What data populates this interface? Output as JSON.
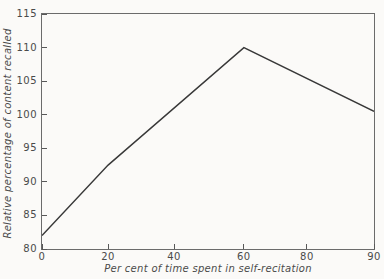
{
  "chart_data": {
    "type": "line",
    "title": "",
    "xlabel": "Per cent of time spent in self-recitation",
    "ylabel": "Relative percentage of content recalled",
    "xlim": [
      0,
      90
    ],
    "ylim": [
      80,
      115
    ],
    "x_ticks": [
      0,
      20,
      40,
      60,
      80,
      90
    ],
    "x_tick_fractions": [
      0,
      0.199,
      0.398,
      0.608,
      0.798,
      1.0
    ],
    "y_ticks": [
      80,
      85,
      90,
      95,
      100,
      105,
      110,
      115
    ],
    "grid": false,
    "legend": false,
    "series": [
      {
        "points": [
          {
            "x": 0,
            "y": 82
          },
          {
            "x": 20,
            "y": 92.5
          },
          {
            "x": 60,
            "y": 110
          },
          {
            "x": 90,
            "y": 100.5
          }
        ]
      }
    ],
    "line_color": "#383838",
    "axis_color": "#6b6b6b",
    "tick_color": "#585858",
    "text_color": "#4a4a4a",
    "background": "#fbfaf8"
  }
}
